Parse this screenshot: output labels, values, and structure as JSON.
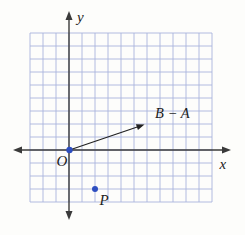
{
  "figure": {
    "background": "#fdfdfb",
    "grid": {
      "left": 30,
      "top": 33,
      "cols": 14,
      "rows": 13,
      "cell": 13,
      "color": "#a9b3dc",
      "stroke_width": 0.9
    },
    "axes": {
      "color": "#3a3a3a",
      "stroke_width": 1.4,
      "arrow": {
        "length": 9,
        "half_width": 3.5
      },
      "x": {
        "label": "x",
        "y": 150,
        "tip_left": 13,
        "tip_right": 231,
        "label_x": 219.5,
        "label_y": 168.5
      },
      "y": {
        "label": "y",
        "x": 69,
        "tip_top": 11,
        "tip_bottom": 220,
        "label_x": 77,
        "label_y": 21.5
      }
    },
    "origin": {
      "label": "O",
      "x": 69.5,
      "y": 150,
      "dot_radius": 3.2,
      "dot_color": "#2d4ec0",
      "label_x": 56.5,
      "label_y": 166
    },
    "vector": {
      "label": "B − A",
      "from_x": 69.5,
      "from_y": 150,
      "tip_x": 144.5,
      "tip_y": 124.5,
      "grid_components": [
        6,
        2
      ],
      "color": "#222222",
      "stroke_width": 1.2,
      "arrow": {
        "length": 8,
        "half_width": 3.1
      },
      "label_x": 155,
      "label_y": 117.5
    },
    "point_p": {
      "label": "P",
      "x": 95,
      "y": 189,
      "grid_coords": [
        2,
        -3
      ],
      "dot_radius": 3,
      "dot_color": "#2d4ec0",
      "label_x": 99.5,
      "label_y": 205
    }
  }
}
